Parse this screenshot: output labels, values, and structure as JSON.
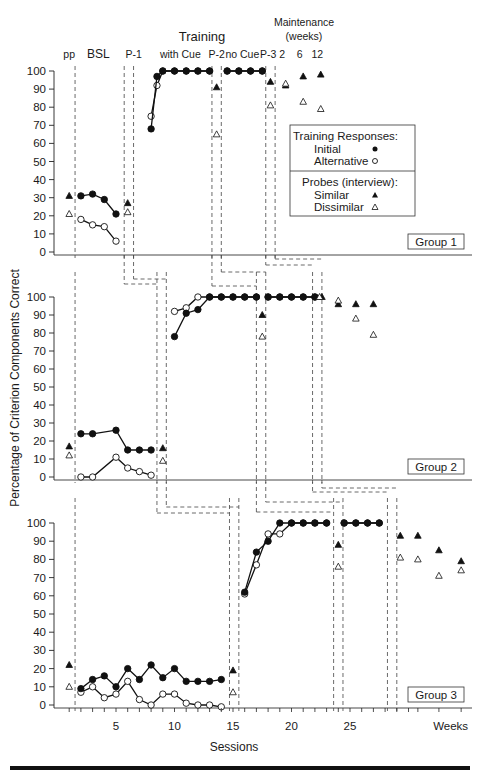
{
  "chart_data": {
    "type": "line",
    "title": "",
    "ylabel": "Percentage of Criterion Components Correct",
    "xlabel": "Sessions",
    "ylim": [
      0,
      100
    ],
    "yticks": [
      0,
      10,
      20,
      30,
      40,
      50,
      60,
      70,
      80,
      90,
      100
    ],
    "xticks": [
      5,
      10,
      15,
      20,
      25
    ],
    "xtick_extra_label": "Weeks",
    "phase_labels": [
      {
        "text": "pp",
        "x": 1
      },
      {
        "text": "BSL",
        "x": 3.5
      },
      {
        "text": "P-1",
        "x": 6.5
      },
      {
        "text": "with Cue",
        "x": 10.5
      },
      {
        "text": "P-2",
        "x": 13.6
      },
      {
        "text": "no Cue",
        "x": 15.8
      },
      {
        "text": "P-3",
        "x": 18.0
      },
      {
        "text": "2",
        "x": 19.2
      },
      {
        "text": "6",
        "x": 20.7
      },
      {
        "text": "12",
        "x": 22.2
      }
    ],
    "top_labels": {
      "training": "Training",
      "maintenance": "Maintenance",
      "maintenance_sub": "(weeks)"
    },
    "legend": {
      "section1_title": "Training Responses:",
      "initial": "Initial",
      "alternative": "Alternative",
      "section2_title": "Probes (interview):",
      "similar": "Similar",
      "dissimilar": "Dissimilar"
    },
    "panels": [
      {
        "name": "Group 1",
        "initial": [
          [
            [
              2,
              31
            ],
            [
              3,
              32
            ],
            [
              4,
              29
            ],
            [
              5,
              21
            ]
          ],
          [
            [
              8,
              68
            ],
            [
              8.5,
              97
            ],
            [
              9,
              100
            ],
            [
              10,
              100
            ],
            [
              11,
              100
            ],
            [
              12,
              100
            ],
            [
              13,
              100
            ]
          ],
          [
            [
              14.5,
              100
            ],
            [
              15.5,
              100
            ],
            [
              16.5,
              100
            ],
            [
              17.5,
              100
            ]
          ]
        ],
        "alternative": [
          [
            [
              2,
              18
            ],
            [
              3,
              15
            ],
            [
              4,
              14
            ],
            [
              5,
              6
            ]
          ],
          [
            [
              8,
              75
            ],
            [
              8.5,
              92
            ],
            [
              9,
              100
            ],
            [
              10,
              100
            ],
            [
              11,
              100
            ],
            [
              12,
              100
            ],
            [
              13,
              100
            ]
          ],
          [
            [
              14.5,
              100
            ],
            [
              15.5,
              100
            ],
            [
              16.5,
              100
            ],
            [
              17.5,
              100
            ]
          ]
        ],
        "similar": [
          [
            1,
            31
          ],
          [
            6,
            27
          ],
          [
            13.6,
            91
          ],
          [
            18.2,
            94
          ],
          [
            19.5,
            92
          ],
          [
            21,
            97
          ],
          [
            22.5,
            98
          ]
        ],
        "dissimilar": [
          [
            1,
            21
          ],
          [
            6,
            22
          ],
          [
            13.6,
            65
          ],
          [
            18.2,
            81
          ],
          [
            19.5,
            93
          ],
          [
            21,
            83
          ],
          [
            22.5,
            79
          ]
        ]
      },
      {
        "name": "Group 2",
        "initial": [
          [
            [
              2,
              24
            ],
            [
              3,
              24
            ],
            [
              5,
              26
            ],
            [
              6,
              15
            ],
            [
              7,
              15
            ],
            [
              8,
              15
            ]
          ],
          [
            [
              10,
              78
            ],
            [
              11,
              91
            ],
            [
              12,
              93
            ],
            [
              13,
              100
            ],
            [
              14,
              100
            ],
            [
              15,
              100
            ],
            [
              16,
              100
            ],
            [
              17,
              100
            ]
          ],
          [
            [
              18,
              100
            ],
            [
              19,
              100
            ],
            [
              20,
              100
            ],
            [
              21,
              100
            ],
            [
              22,
              100
            ]
          ]
        ],
        "alternative": [
          [
            [
              2,
              0
            ],
            [
              3,
              0
            ],
            [
              5,
              11
            ],
            [
              6,
              5
            ],
            [
              7,
              3
            ],
            [
              8,
              1
            ]
          ],
          [
            [
              10,
              92
            ],
            [
              11,
              94
            ],
            [
              12,
              100
            ],
            [
              13,
              100
            ],
            [
              14,
              100
            ],
            [
              15,
              100
            ],
            [
              16,
              100
            ],
            [
              17,
              100
            ]
          ],
          [
            [
              18,
              100
            ],
            [
              19,
              100
            ],
            [
              20,
              100
            ],
            [
              21,
              100
            ],
            [
              22,
              100
            ]
          ]
        ],
        "similar": [
          [
            1,
            17
          ],
          [
            9,
            16
          ],
          [
            17.5,
            90
          ],
          [
            22.6,
            100
          ],
          [
            24,
            96
          ],
          [
            25.5,
            96
          ],
          [
            27,
            96
          ]
        ],
        "dissimilar": [
          [
            1,
            12
          ],
          [
            9,
            9
          ],
          [
            17.5,
            78
          ],
          [
            22.4,
            100
          ],
          [
            24,
            98
          ],
          [
            25.5,
            88
          ],
          [
            27,
            79
          ]
        ]
      },
      {
        "name": "Group 3",
        "initial": [
          [
            [
              2,
              9
            ],
            [
              3,
              14
            ],
            [
              4,
              16
            ],
            [
              5,
              10
            ],
            [
              6,
              20
            ],
            [
              7,
              14
            ],
            [
              8,
              22
            ],
            [
              9,
              15
            ],
            [
              10,
              20
            ],
            [
              11,
              13
            ],
            [
              12,
              13
            ],
            [
              13,
              13
            ],
            [
              14,
              14
            ]
          ],
          [
            [
              16,
              62
            ],
            [
              17,
              84
            ],
            [
              18,
              90
            ],
            [
              19,
              100
            ],
            [
              20,
              100
            ],
            [
              21,
              100
            ],
            [
              22,
              100
            ],
            [
              23,
              100
            ]
          ],
          [
            [
              24.5,
              100
            ],
            [
              25.5,
              100
            ],
            [
              26.5,
              100
            ],
            [
              27.5,
              100
            ]
          ]
        ],
        "alternative": [
          [
            [
              2,
              7
            ],
            [
              3,
              10
            ],
            [
              4,
              4
            ],
            [
              5,
              6
            ],
            [
              6,
              13
            ],
            [
              7,
              3
            ],
            [
              8,
              0
            ],
            [
              9,
              6
            ],
            [
              10,
              6
            ],
            [
              11,
              1
            ],
            [
              12,
              0
            ],
            [
              13,
              0
            ],
            [
              14,
              -1
            ]
          ],
          [
            [
              16,
              61
            ],
            [
              17,
              77
            ],
            [
              18,
              94
            ],
            [
              19,
              94
            ],
            [
              20,
              100
            ],
            [
              21,
              100
            ],
            [
              22,
              100
            ],
            [
              23,
              100
            ]
          ],
          [
            [
              24.5,
              100
            ],
            [
              25.5,
              100
            ],
            [
              26.5,
              100
            ],
            [
              27.5,
              100
            ]
          ]
        ],
        "similar": [
          [
            1,
            22
          ],
          [
            15,
            19
          ],
          [
            24,
            88
          ],
          [
            29.3,
            93
          ],
          [
            30.8,
            93
          ],
          [
            32.6,
            85
          ],
          [
            34.5,
            79
          ]
        ],
        "dissimilar": [
          [
            1,
            10
          ],
          [
            15,
            7
          ],
          [
            24,
            76
          ],
          [
            29.3,
            81
          ],
          [
            30.8,
            80
          ],
          [
            32.6,
            71
          ],
          [
            34.5,
            74
          ]
        ]
      }
    ],
    "phase_lines": [
      {
        "panel": 0,
        "x": [
          1.5,
          5.7,
          6.5,
          13.2,
          14.0,
          17.8,
          18.6
        ]
      },
      {
        "panel": 1,
        "x": [
          1.5,
          8.5,
          9.3,
          17.0,
          17.8,
          21.8,
          22.6
        ]
      },
      {
        "panel": 2,
        "x": [
          1.5,
          14.7,
          15.5,
          23.6,
          24.4,
          28.2,
          29.0
        ]
      }
    ]
  },
  "page": {
    "title_training": "Training",
    "title_maintenance": "Maintenance",
    "title_maintenance_weeks": "(weeks)",
    "xlabel": "Sessions",
    "ylabel": "Percentage of Criterion Components Correct",
    "weeks_label": "Weeks",
    "group_labels": [
      "Group 1",
      "Group 2",
      "Group 3"
    ]
  }
}
